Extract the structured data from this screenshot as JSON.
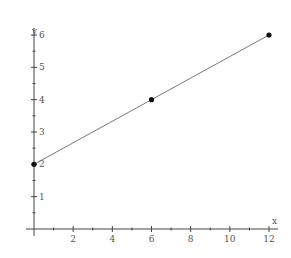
{
  "chart_data": {
    "type": "line",
    "title": "",
    "xlabel": "x",
    "ylabel": "y",
    "xlim": [
      0,
      12
    ],
    "ylim": [
      0,
      6
    ],
    "grid": false,
    "x_ticks_major": [
      2,
      4,
      6,
      8,
      10,
      12
    ],
    "x_ticks_minor": [
      1,
      3,
      5,
      7,
      9,
      11
    ],
    "y_ticks_major": [
      1,
      2,
      3,
      4,
      5,
      6
    ],
    "y_ticks_minor": [
      0.5,
      1.5,
      2.5,
      3.5,
      4.5,
      5.5
    ],
    "series": [
      {
        "name": "line",
        "points": [
          {
            "x": 0,
            "y": 2
          },
          {
            "x": 6,
            "y": 4
          },
          {
            "x": 12,
            "y": 6
          }
        ],
        "markers": true
      }
    ],
    "colors": {
      "axis": "#444444",
      "line": "#555555",
      "marker": "#111111",
      "text": "#555555"
    }
  }
}
